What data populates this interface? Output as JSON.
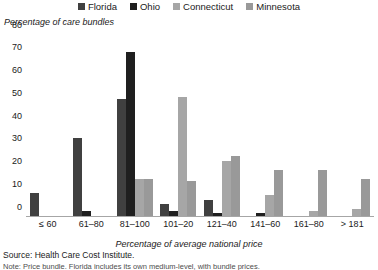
{
  "chart_data": {
    "type": "bar",
    "title": "",
    "ylabel": "Percentage of care bundles",
    "xlabel": "Percentage of average national price",
    "ylim": [
      0,
      80
    ],
    "ytick_step": 10,
    "yticks": [
      80,
      70,
      60,
      50,
      40,
      30,
      20,
      10,
      0
    ],
    "grid": false,
    "legend_position": "top-center",
    "categories": [
      "≤ 60",
      "61–80",
      "81–100",
      "101–20",
      "121–40",
      "141–60",
      "161–80",
      "> 181"
    ],
    "series": [
      {
        "name": "Florida",
        "color": "#404040",
        "values": [
          10,
          34,
          51,
          5,
          7,
          0,
          0,
          0
        ]
      },
      {
        "name": "Ohio",
        "color": "#1f1f1f",
        "values": [
          0,
          2,
          72,
          2,
          1,
          1,
          0,
          0
        ]
      },
      {
        "name": "Connecticut",
        "color": "#a6a6a6",
        "values": [
          0,
          0,
          16,
          52,
          24,
          9,
          2,
          3
        ]
      },
      {
        "name": "Minnesota",
        "color": "#999999",
        "values": [
          0,
          0,
          16,
          15,
          26,
          20,
          20,
          16
        ]
      }
    ]
  },
  "footer": {
    "source": "Source: Health Care Cost Institute.",
    "note": "Note: Price bundle. Florida includes its own medium-level, with bundle prices."
  }
}
